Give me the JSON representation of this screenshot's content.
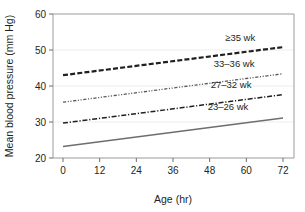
{
  "chart_data": {
    "type": "line",
    "title": "",
    "xlabel": "Age (hr)",
    "ylabel": "Mean blood pressure (mm Hg)",
    "xlim": [
      0,
      72
    ],
    "ylim": [
      20,
      60
    ],
    "xticks": [
      0,
      12,
      24,
      36,
      48,
      60,
      72
    ],
    "yticks": [
      20,
      30,
      40,
      50,
      60
    ],
    "xtick_labels": [
      "0",
      "12",
      "24",
      "36",
      "48",
      "60",
      "72"
    ],
    "ytick_labels": [
      "20",
      "30",
      "40",
      "50",
      "60"
    ],
    "grid": true,
    "legend_position": "inline-right",
    "x": [
      0,
      72
    ],
    "series": [
      {
        "name": "≥35 wk",
        "values": [
          43.0,
          50.8
        ],
        "style": "dashed",
        "color": "#231f20",
        "width": 2.2,
        "label_x": 58,
        "label_y": 52.6
      },
      {
        "name": "33–36 wk",
        "values": [
          35.5,
          43.4
        ],
        "style": "dash-dot-dot",
        "color": "#58595b",
        "width": 1.3,
        "label_x": 56,
        "label_y": 45.2
      },
      {
        "name": "27–32 wk",
        "values": [
          29.7,
          37.6
        ],
        "style": "dash-dot",
        "color": "#231f20",
        "width": 1.5,
        "label_x": 55,
        "label_y": 39.4
      },
      {
        "name": "23–26 wk",
        "values": [
          23.2,
          31.1
        ],
        "style": "solid",
        "color": "#6d6e71",
        "width": 1.6,
        "label_x": 54,
        "label_y": 33.4
      }
    ]
  },
  "axes": {
    "x_title": "Age (hr)",
    "y_title": "Mean blood pressure (mm Hg)"
  }
}
